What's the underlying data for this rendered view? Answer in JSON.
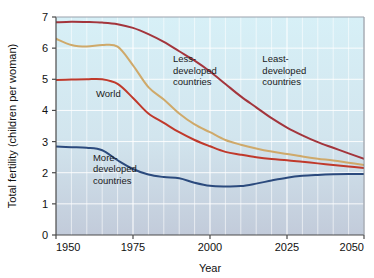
{
  "chart_data": {
    "type": "line",
    "title": "",
    "xlabel": "Year",
    "ylabel": "Total fertility (children per woman)",
    "xlim": [
      1950,
      2050
    ],
    "ylim": [
      0,
      7
    ],
    "xticks": [
      "1950",
      "1975",
      "2000",
      "2025",
      "2050"
    ],
    "xtick_values": [
      1950,
      1975,
      2000,
      2025,
      2050
    ],
    "yticks": [
      "0",
      "1",
      "2",
      "3",
      "4",
      "5",
      "6",
      "7"
    ],
    "ytick_values": [
      0,
      1,
      2,
      3,
      4,
      5,
      6,
      7
    ],
    "grid": true,
    "grid_color": "#ffffff",
    "plot_bg_top": "#d5eef5",
    "plot_bg_bottom": "#c3ccdb",
    "legend_position": "inline-annotations",
    "x": [
      1950,
      1955,
      1960,
      1965,
      1970,
      1975,
      1980,
      1985,
      1990,
      1995,
      2000,
      2005,
      2010,
      2015,
      2020,
      2025,
      2030,
      2035,
      2040,
      2045,
      2050
    ],
    "series": [
      {
        "name": "Least-developed countries",
        "color": "#a3353c",
        "label": "Least-\ndeveloped\ncountries",
        "label_lines": [
          "Least-",
          "developed",
          "countries"
        ],
        "label_x": 2017,
        "label_y": 5.55,
        "values": [
          6.83,
          6.85,
          6.84,
          6.82,
          6.77,
          6.65,
          6.45,
          6.2,
          5.9,
          5.6,
          5.25,
          4.85,
          4.45,
          4.1,
          3.75,
          3.45,
          3.2,
          2.98,
          2.8,
          2.62,
          2.45
        ]
      },
      {
        "name": "Less-developed countries",
        "color": "#cfa96a",
        "label": "Less-\ndeveloped\ncountries",
        "label_lines": [
          "Less-",
          "developed",
          "countries"
        ],
        "label_x": 1988,
        "label_y": 5.55,
        "values": [
          6.3,
          6.1,
          6.05,
          6.1,
          6.05,
          5.45,
          4.75,
          4.35,
          3.9,
          3.55,
          3.3,
          3.05,
          2.9,
          2.78,
          2.68,
          2.6,
          2.52,
          2.45,
          2.39,
          2.32,
          2.25
        ]
      },
      {
        "name": "World",
        "color": "#c0392b",
        "label": "World",
        "label_lines": [
          "World"
        ],
        "label_x": 1963,
        "label_y": 4.42,
        "values": [
          4.98,
          4.99,
          5.0,
          5.0,
          4.85,
          4.4,
          3.9,
          3.6,
          3.3,
          3.05,
          2.85,
          2.67,
          2.58,
          2.5,
          2.44,
          2.4,
          2.35,
          2.3,
          2.25,
          2.2,
          2.15
        ]
      },
      {
        "name": "More-developed countries",
        "color": "#2b4a7d",
        "label": "More-\ndeveloped\ncountries",
        "label_lines": [
          "More-",
          "developed",
          "countries"
        ],
        "label_x": 1962,
        "label_y": 2.38,
        "values": [
          2.84,
          2.82,
          2.8,
          2.72,
          2.4,
          2.12,
          1.94,
          1.86,
          1.82,
          1.68,
          1.58,
          1.56,
          1.57,
          1.65,
          1.75,
          1.84,
          1.9,
          1.93,
          1.95,
          1.96,
          1.96
        ]
      }
    ]
  },
  "axis": {
    "x_title": "Year",
    "y_title": "Total fertility (children per woman)"
  }
}
